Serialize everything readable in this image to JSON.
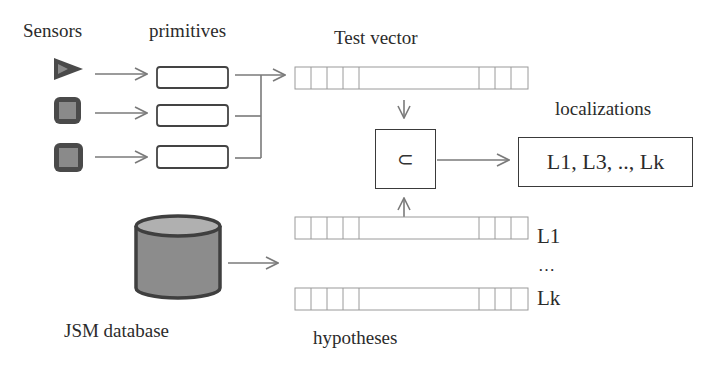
{
  "labels": {
    "sensors": "Sensors",
    "primitives": "primitives",
    "test_vector": "Test vector",
    "localizations": "localizations",
    "jsm_database": "JSM database",
    "hypotheses": "hypotheses",
    "hyp_first": "L1",
    "hyp_ellipsis": "…",
    "hyp_last": "Lk"
  },
  "subset_box": {
    "symbol": "⊂",
    "icon": "subset-icon"
  },
  "localizations_box": {
    "text": "L1, L3, .., Lk"
  },
  "sensors": [
    {
      "shape": "triangle",
      "icon": "triangle-sensor-icon"
    },
    {
      "shape": "rounded-square",
      "icon": "square-sensor-icon"
    },
    {
      "shape": "rounded-square",
      "icon": "square-sensor-icon"
    }
  ],
  "colors": {
    "line": "#7a7a7a",
    "box_border": "#3a3a3a",
    "sensor_fill": "#4a4a4a",
    "sensor_inner": "#8a8a8a",
    "db_fill": "#8c8c8c",
    "db_border": "#3f3f3f"
  }
}
